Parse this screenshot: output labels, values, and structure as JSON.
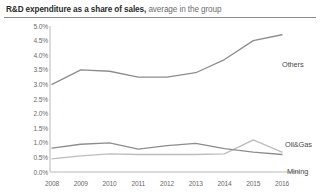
{
  "title": {
    "strong": "R&D expenditure as a share of sales,",
    "rest": " average in the group"
  },
  "chart_data": {
    "type": "line",
    "title": "R&D expenditure as a share of sales, average in the group",
    "xlabel": "",
    "ylabel": "",
    "x": [
      2008,
      2009,
      2010,
      2011,
      2012,
      2013,
      2014,
      2015,
      2016
    ],
    "categories": [
      "2008",
      "2009",
      "2010",
      "2011",
      "2012",
      "2013",
      "2014",
      "2015",
      "2016"
    ],
    "ylim": [
      0.0,
      5.0
    ],
    "ytick_values": [
      0.0,
      0.5,
      1.0,
      1.5,
      2.0,
      2.5,
      3.0,
      3.5,
      4.0,
      4.5,
      5.0
    ],
    "ytick_labels": [
      "0.0%",
      "0.5%",
      "1.0%",
      "1.5%",
      "2.0%",
      "2.5%",
      "3.0%",
      "3.5%",
      "4.0%",
      "4.5%",
      "5.0%"
    ],
    "grid": false,
    "legend": "inline-right-labels",
    "series": [
      {
        "name": "Others",
        "color": "#8d8d8d",
        "values": [
          3.0,
          3.5,
          3.45,
          3.25,
          3.25,
          3.4,
          3.85,
          4.5,
          4.7
        ]
      },
      {
        "name": "Oil&Gas",
        "color": "#bdbdbd",
        "values": [
          0.45,
          0.55,
          0.62,
          0.6,
          0.6,
          0.6,
          0.62,
          1.1,
          0.68
        ]
      },
      {
        "name": "Mining",
        "color": "#8d8d8d",
        "values": [
          0.82,
          0.95,
          1.0,
          0.78,
          0.9,
          0.98,
          0.8,
          0.68,
          0.6
        ]
      }
    ]
  },
  "axis": {
    "y_labels": [
      "5.0%",
      "4.5%",
      "4.0%",
      "3.5%",
      "3.0%",
      "2.5%",
      "2.0%",
      "1.5%",
      "1.0%",
      "0.5%",
      "0.0%"
    ],
    "x_labels": [
      "2008",
      "2009",
      "2010",
      "2011",
      "2012",
      "2013",
      "2014",
      "2015",
      "2016"
    ]
  },
  "series_labels": {
    "others": "Others",
    "oilgas": "Oil&Gas",
    "mining": "Mining"
  }
}
